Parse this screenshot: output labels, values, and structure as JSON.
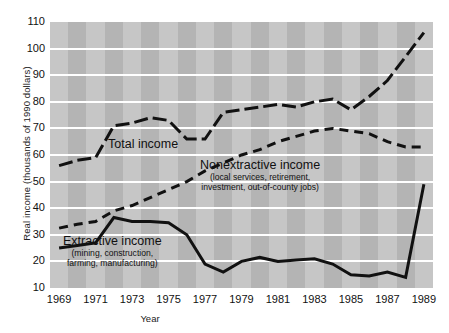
{
  "figure": {
    "background": "#ffffff",
    "plot_bg": "#b4b4b4",
    "band_color": "#c6c6c6",
    "grid_color": "#ffffff",
    "line_color": "#111111"
  },
  "axes": {
    "ylabel": "Real income (thousands of 1990 dollars)",
    "xlabel": "Year",
    "yticks": [
      "110",
      "100",
      "90",
      "80",
      "70",
      "60",
      "50",
      "40",
      "30",
      "20",
      "10"
    ],
    "xticks": [
      "1969",
      "1971",
      "1973",
      "1975",
      "1977",
      "1979",
      "1981",
      "1983",
      "1985",
      "1987",
      "1989"
    ]
  },
  "annotations": {
    "total": {
      "title": "Total income"
    },
    "nonextractive": {
      "title": "Nonextractive income",
      "sub1": "(local services, retirement,",
      "sub2": "investment, out-of-county jobs)"
    },
    "extractive": {
      "title": "Extractive income",
      "sub1": "(mining, construction,",
      "sub2": "farming, manufacturing)"
    }
  },
  "chart_data": {
    "type": "line",
    "title": "",
    "xlabel": "Year",
    "ylabel": "Real income (thousands of 1990 dollars)",
    "xlim": [
      1968.5,
      1989.5
    ],
    "ylim": [
      10,
      110
    ],
    "grid": true,
    "legend": "inline-annotations",
    "x": [
      1969,
      1970,
      1971,
      1972,
      1973,
      1974,
      1975,
      1976,
      1977,
      1978,
      1979,
      1980,
      1981,
      1982,
      1983,
      1984,
      1985,
      1986,
      1987,
      1988,
      1989
    ],
    "series": [
      {
        "name": "Total income",
        "style": "dash-dot",
        "values": [
          56,
          58,
          59,
          71,
          72,
          74,
          73,
          66,
          66,
          76,
          77,
          78,
          79,
          78,
          80,
          81,
          77,
          82,
          88,
          97,
          106
        ]
      },
      {
        "name": "Nonextractive income",
        "style": "dashed",
        "values": [
          32.5,
          34,
          35,
          39,
          41,
          44,
          47,
          50,
          54,
          57,
          60,
          62,
          65,
          67,
          69,
          70,
          69,
          68,
          65,
          63,
          63
        ]
      },
      {
        "name": "Extractive income",
        "style": "solid",
        "values": [
          25,
          26,
          27,
          36.5,
          35,
          35,
          34.5,
          30,
          19,
          16,
          20,
          21.5,
          20,
          20.5,
          21,
          19,
          15,
          14.5,
          16,
          14,
          49
        ]
      }
    ]
  }
}
